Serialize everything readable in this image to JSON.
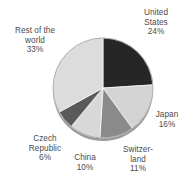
{
  "chart_data": {
    "type": "pie",
    "title": "",
    "subtitle": "",
    "xlabel": "",
    "ylabel": "",
    "legend_position": "none",
    "grid": false,
    "labels_show_percent": true,
    "start_angle_deg": 0,
    "direction": "clockwise",
    "categories": [
      "United States",
      "Japan",
      "Switzerland",
      "China",
      "Czech Republic",
      "Rest of the world"
    ],
    "values": [
      24,
      16,
      11,
      10,
      6,
      33
    ],
    "units": "%",
    "total": 100,
    "slices": [
      {
        "name": "United States",
        "label_text": "United\nStates\n24%",
        "value": 24,
        "percent_text": "24%",
        "color": "#262626",
        "start_deg": 0.0,
        "end_deg": 86.4
      },
      {
        "name": "Japan",
        "label_text": "Japan\n16%",
        "value": 16,
        "percent_text": "16%",
        "color": "#d4d4d4",
        "start_deg": 86.4,
        "end_deg": 144.0
      },
      {
        "name": "Switzerland",
        "label_text": "Switzer-\nland\n11%",
        "value": 11,
        "percent_text": "11%",
        "color": "#8a8a8a",
        "start_deg": 144.0,
        "end_deg": 183.6
      },
      {
        "name": "China",
        "label_text": "China\n10%",
        "value": 10,
        "percent_text": "10%",
        "color": "#d8d8d8",
        "start_deg": 183.6,
        "end_deg": 219.6
      },
      {
        "name": "Czech Republic",
        "label_text": "Czech\nRepublic\n6%",
        "value": 6,
        "percent_text": "6%",
        "color": "#5a5a5a",
        "start_deg": 219.6,
        "end_deg": 241.2
      },
      {
        "name": "Rest of the world",
        "label_text": "Rest of the\nworld\n33%",
        "value": 33,
        "percent_text": "33%",
        "color": "#dcdcdc",
        "start_deg": 241.2,
        "end_deg": 360.0
      }
    ]
  },
  "figure": {
    "background_color": "#ffffff",
    "label_color": "#4a4a4a",
    "rim_color": "#9a9a9a",
    "center_x": 103,
    "center_y": 88,
    "radius": 50
  }
}
